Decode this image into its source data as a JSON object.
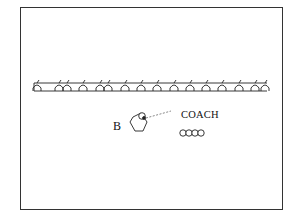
{
  "diagram": {
    "type": "sports-drill",
    "labels": {
      "player": "B",
      "coach": "COACH"
    },
    "barrier": {
      "description": "row of hurdles between two parallel lines",
      "hurdle_count": 16,
      "hurdles_x": [
        37,
        59,
        67,
        83,
        100,
        108,
        125,
        141,
        157,
        174,
        190,
        206,
        222,
        239,
        255,
        265
      ]
    },
    "player_marker": {
      "shape": "pentagon",
      "has_ball": true
    },
    "pass_line": {
      "style": "dashed",
      "from": "player",
      "to": "coach"
    },
    "coach_balls": {
      "count": 4,
      "shape": "circle"
    },
    "colors": {
      "stroke": "#222222",
      "background": "#ffffff"
    }
  }
}
